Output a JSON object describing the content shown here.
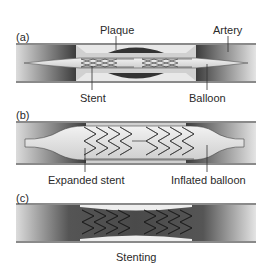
{
  "panels": [
    {
      "id": "a",
      "label": "(a)",
      "callouts": {
        "top_left": "Plaque",
        "top_right": "Artery",
        "bottom_left": "Stent",
        "bottom_right": "Balloon"
      }
    },
    {
      "id": "b",
      "label": "(b)",
      "callouts": {
        "bottom_left": "Expanded stent",
        "bottom_right": "Inflated balloon"
      }
    },
    {
      "id": "c",
      "label": "(c)"
    }
  ],
  "caption": "Stenting",
  "colors": {
    "artery_wall": "#8a8a8a",
    "plaque_dark": "#3a3a3a",
    "lumen_light": "#e6e6e6",
    "balloon": "#d8d8d8",
    "stent_line": "#333333"
  }
}
